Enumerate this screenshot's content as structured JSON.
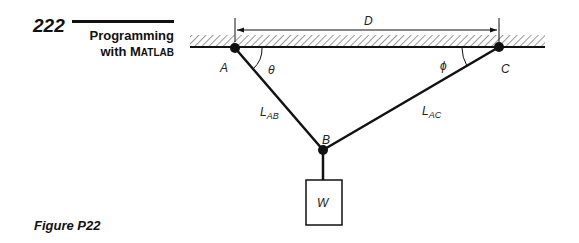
{
  "header": {
    "page_number": "222",
    "running_title_line1": "Programming",
    "running_title_line2_prefix": "with M",
    "running_title_line2_smallcaps": "ATLAB"
  },
  "figure": {
    "caption": "Figure P22",
    "labels": {
      "dimension": "D",
      "point_a": "A",
      "point_b": "B",
      "point_c": "C",
      "angle_theta": "θ",
      "angle_phi": "ϕ",
      "length_ab_main": "L",
      "length_ab_sub": "AB",
      "length_ac_main": "L",
      "length_ac_sub": "AC",
      "weight": "W"
    },
    "colors": {
      "ink": "#111111",
      "hatch": "#555555"
    }
  }
}
